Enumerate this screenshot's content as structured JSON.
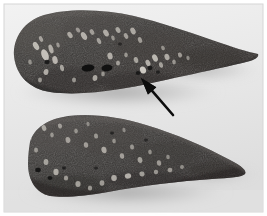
{
  "figure": {
    "kind": "gross-pathology-photograph",
    "caption": "",
    "width": 267,
    "height": 216,
    "background_color": "#ffffff",
    "photo_paper_color": "#ebebeb",
    "vignette_color": "#dcdcdc"
  },
  "specimens": [
    {
      "id": "upper-slice",
      "label": "",
      "description": "upper cut tissue slice, rounded left end tapering to a point at right",
      "tissue_color": "#3c3a38",
      "tissue_color_dark": "#2b2a29",
      "tissue_color_light": "#5a5653",
      "edge_color": "#1d1c1c",
      "shadow_color": "#b9b9b9"
    },
    {
      "id": "lower-slice",
      "label": "",
      "description": "lower cut tissue slice, wedge shaped tapering to a sharp point at right",
      "tissue_color": "#3a3836",
      "tissue_color_dark": "#2a2928",
      "tissue_color_light": "#575350",
      "edge_color": "#1c1b1b",
      "shadow_color": "#bcbcbc"
    }
  ],
  "annotations": [
    {
      "id": "lesion-arrow",
      "type": "arrow",
      "label": "",
      "color": "#0c0c0c",
      "tip_x": 141,
      "tip_y": 78,
      "tail_x": 173,
      "tail_y": 115,
      "shaft_width": 2.6,
      "head_length": 17,
      "head_width": 11,
      "points_to": "pale lesion on upper slice"
    }
  ],
  "features": {
    "pale_nodule_color": "#d8d4cc",
    "pale_nodule_soft_color": "#a9a49c",
    "cavity_color": "#111111",
    "upper_pale_nodules": [
      {
        "cx": 36,
        "cy": 46,
        "rx": 2.6,
        "ry": 4.4,
        "rot": -30,
        "o": 0.8
      },
      {
        "cx": 41,
        "cy": 39,
        "rx": 1.8,
        "ry": 3.0,
        "rot": -25,
        "o": 0.62
      },
      {
        "cx": 45,
        "cy": 55,
        "rx": 3.4,
        "ry": 6.0,
        "rot": -22,
        "o": 0.85
      },
      {
        "cx": 51,
        "cy": 49,
        "rx": 2.2,
        "ry": 4.6,
        "rot": -18,
        "o": 0.7
      },
      {
        "cx": 55,
        "cy": 60,
        "rx": 2.6,
        "ry": 4.0,
        "rot": -15,
        "o": 0.78
      },
      {
        "cx": 58,
        "cy": 45,
        "rx": 1.6,
        "ry": 2.6,
        "rot": -20,
        "o": 0.55
      },
      {
        "cx": 62,
        "cy": 68,
        "rx": 2.0,
        "ry": 3.2,
        "rot": -10,
        "o": 0.66
      },
      {
        "cx": 46,
        "cy": 72,
        "rx": 2.4,
        "ry": 3.0,
        "rot": 10,
        "o": 0.72
      },
      {
        "cx": 40,
        "cy": 80,
        "rx": 2.0,
        "ry": 2.4,
        "rot": 0,
        "o": 0.58
      },
      {
        "cx": 70,
        "cy": 35,
        "rx": 2.2,
        "ry": 3.4,
        "rot": -35,
        "o": 0.68
      },
      {
        "cx": 78,
        "cy": 30,
        "rx": 1.8,
        "ry": 2.8,
        "rot": -40,
        "o": 0.55
      },
      {
        "cx": 84,
        "cy": 36,
        "rx": 2.6,
        "ry": 4.2,
        "rot": -30,
        "o": 0.74
      },
      {
        "cx": 92,
        "cy": 32,
        "rx": 2.0,
        "ry": 3.0,
        "rot": -30,
        "o": 0.6
      },
      {
        "cx": 99,
        "cy": 41,
        "rx": 1.9,
        "ry": 3.2,
        "rot": -25,
        "o": 0.63
      },
      {
        "cx": 106,
        "cy": 33,
        "rx": 2.4,
        "ry": 3.8,
        "rot": -30,
        "o": 0.7
      },
      {
        "cx": 113,
        "cy": 38,
        "rx": 1.7,
        "ry": 2.6,
        "rot": -20,
        "o": 0.54
      },
      {
        "cx": 118,
        "cy": 30,
        "rx": 2.2,
        "ry": 3.2,
        "rot": -28,
        "o": 0.66
      },
      {
        "cx": 126,
        "cy": 36,
        "rx": 2.0,
        "ry": 3.0,
        "rot": -25,
        "o": 0.62
      },
      {
        "cx": 133,
        "cy": 31,
        "rx": 2.4,
        "ry": 3.6,
        "rot": -28,
        "o": 0.68
      },
      {
        "cx": 140,
        "cy": 40,
        "rx": 2.0,
        "ry": 3.0,
        "rot": -22,
        "o": 0.6
      },
      {
        "cx": 110,
        "cy": 56,
        "rx": 2.6,
        "ry": 3.4,
        "rot": -12,
        "o": 0.72
      },
      {
        "cx": 118,
        "cy": 63,
        "rx": 2.0,
        "ry": 2.6,
        "rot": 0,
        "o": 0.62
      },
      {
        "cx": 126,
        "cy": 55,
        "rx": 1.8,
        "ry": 2.4,
        "rot": -10,
        "o": 0.56
      },
      {
        "cx": 136,
        "cy": 60,
        "rx": 2.2,
        "ry": 3.0,
        "rot": -15,
        "o": 0.66
      },
      {
        "cx": 143,
        "cy": 70,
        "rx": 3.0,
        "ry": 3.6,
        "rot": -20,
        "o": 0.92
      },
      {
        "cx": 148,
        "cy": 63,
        "rx": 2.2,
        "ry": 3.4,
        "rot": -25,
        "o": 0.74
      },
      {
        "cx": 155,
        "cy": 58,
        "rx": 2.6,
        "ry": 3.8,
        "rot": -25,
        "o": 0.8
      },
      {
        "cx": 161,
        "cy": 65,
        "rx": 2.0,
        "ry": 2.8,
        "rot": -18,
        "o": 0.64
      },
      {
        "cx": 167,
        "cy": 57,
        "rx": 2.4,
        "ry": 3.2,
        "rot": -22,
        "o": 0.7
      },
      {
        "cx": 174,
        "cy": 62,
        "rx": 1.8,
        "ry": 2.4,
        "rot": -15,
        "o": 0.56
      },
      {
        "cx": 180,
        "cy": 55,
        "rx": 2.0,
        "ry": 2.6,
        "rot": -20,
        "o": 0.6
      },
      {
        "cx": 188,
        "cy": 58,
        "rx": 1.6,
        "ry": 2.2,
        "rot": -15,
        "o": 0.5
      },
      {
        "cx": 163,
        "cy": 48,
        "rx": 1.8,
        "ry": 2.4,
        "rot": -25,
        "o": 0.52
      },
      {
        "cx": 95,
        "cy": 78,
        "rx": 2.4,
        "ry": 3.0,
        "rot": 5,
        "o": 0.7
      },
      {
        "cx": 103,
        "cy": 74,
        "rx": 1.8,
        "ry": 2.4,
        "rot": 0,
        "o": 0.56
      },
      {
        "cx": 74,
        "cy": 80,
        "rx": 2.0,
        "ry": 2.4,
        "rot": 5,
        "o": 0.58
      },
      {
        "cx": 30,
        "cy": 62,
        "rx": 1.8,
        "ry": 2.6,
        "rot": -10,
        "o": 0.52
      }
    ],
    "upper_cavities": [
      {
        "cx": 88,
        "cy": 68,
        "rx": 6.4,
        "ry": 3.6,
        "rot": -6,
        "o": 0.95
      },
      {
        "cx": 107,
        "cy": 68,
        "rx": 5.6,
        "ry": 3.4,
        "rot": -4,
        "o": 0.92
      },
      {
        "cx": 47,
        "cy": 62,
        "rx": 2.6,
        "ry": 2.2,
        "rot": 0,
        "o": 0.8
      },
      {
        "cx": 138,
        "cy": 73,
        "rx": 2.4,
        "ry": 2.0,
        "rot": 0,
        "o": 0.78
      },
      {
        "cx": 150,
        "cy": 68,
        "rx": 2.6,
        "ry": 2.2,
        "rot": -10,
        "o": 0.8
      },
      {
        "cx": 158,
        "cy": 72,
        "rx": 2.0,
        "ry": 1.8,
        "rot": 0,
        "o": 0.7
      },
      {
        "cx": 120,
        "cy": 44,
        "rx": 1.8,
        "ry": 1.5,
        "rot": 0,
        "o": 0.62
      }
    ],
    "lower_pale_nodules": [
      {
        "cx": 44,
        "cy": 128,
        "rx": 2.2,
        "ry": 3.0,
        "rot": -20,
        "o": 0.66
      },
      {
        "cx": 52,
        "cy": 135,
        "rx": 1.8,
        "ry": 2.4,
        "rot": -15,
        "o": 0.54
      },
      {
        "cx": 60,
        "cy": 126,
        "rx": 2.0,
        "ry": 2.6,
        "rot": -20,
        "o": 0.58
      },
      {
        "cx": 68,
        "cy": 140,
        "rx": 2.4,
        "ry": 3.0,
        "rot": -10,
        "o": 0.62
      },
      {
        "cx": 76,
        "cy": 131,
        "rx": 1.8,
        "ry": 2.4,
        "rot": -15,
        "o": 0.52
      },
      {
        "cx": 86,
        "cy": 145,
        "rx": 2.2,
        "ry": 2.8,
        "rot": -10,
        "o": 0.6
      },
      {
        "cx": 96,
        "cy": 136,
        "rx": 2.0,
        "ry": 2.6,
        "rot": -12,
        "o": 0.56
      },
      {
        "cx": 104,
        "cy": 150,
        "rx": 2.6,
        "ry": 3.2,
        "rot": -8,
        "o": 0.68
      },
      {
        "cx": 114,
        "cy": 141,
        "rx": 1.8,
        "ry": 2.4,
        "rot": -10,
        "o": 0.52
      },
      {
        "cx": 122,
        "cy": 156,
        "rx": 2.2,
        "ry": 2.8,
        "rot": -8,
        "o": 0.62
      },
      {
        "cx": 132,
        "cy": 147,
        "rx": 2.0,
        "ry": 2.6,
        "rot": -10,
        "o": 0.56
      },
      {
        "cx": 140,
        "cy": 160,
        "rx": 2.4,
        "ry": 3.0,
        "rot": -8,
        "o": 0.64
      },
      {
        "cx": 150,
        "cy": 152,
        "rx": 1.8,
        "ry": 2.4,
        "rot": -10,
        "o": 0.52
      },
      {
        "cx": 159,
        "cy": 163,
        "rx": 2.2,
        "ry": 2.8,
        "rot": -8,
        "o": 0.6
      },
      {
        "cx": 168,
        "cy": 157,
        "rx": 1.8,
        "ry": 2.2,
        "rot": -10,
        "o": 0.5
      },
      {
        "cx": 36,
        "cy": 150,
        "rx": 2.0,
        "ry": 2.6,
        "rot": 0,
        "o": 0.56
      },
      {
        "cx": 46,
        "cy": 162,
        "rx": 2.4,
        "ry": 3.0,
        "rot": 0,
        "o": 0.64
      },
      {
        "cx": 56,
        "cy": 172,
        "rx": 2.6,
        "ry": 3.2,
        "rot": 0,
        "o": 0.7
      },
      {
        "cx": 66,
        "cy": 178,
        "rx": 2.2,
        "ry": 2.6,
        "rot": 0,
        "o": 0.6
      },
      {
        "cx": 78,
        "cy": 184,
        "rx": 2.6,
        "ry": 3.0,
        "rot": 0,
        "o": 0.66
      },
      {
        "cx": 90,
        "cy": 188,
        "rx": 2.2,
        "ry": 2.6,
        "rot": 0,
        "o": 0.58
      },
      {
        "cx": 102,
        "cy": 183,
        "rx": 2.4,
        "ry": 2.8,
        "rot": 0,
        "o": 0.62
      },
      {
        "cx": 114,
        "cy": 178,
        "rx": 2.8,
        "ry": 3.0,
        "rot": -5,
        "o": 0.72
      },
      {
        "cx": 128,
        "cy": 176,
        "rx": 3.2,
        "ry": 2.6,
        "rot": -8,
        "o": 0.76
      },
      {
        "cx": 142,
        "cy": 174,
        "rx": 2.6,
        "ry": 2.4,
        "rot": -8,
        "o": 0.64
      },
      {
        "cx": 156,
        "cy": 172,
        "rx": 2.2,
        "ry": 2.2,
        "rot": -8,
        "o": 0.58
      },
      {
        "cx": 170,
        "cy": 170,
        "rx": 2.4,
        "ry": 2.2,
        "rot": -8,
        "o": 0.6
      },
      {
        "cx": 182,
        "cy": 167,
        "rx": 2.0,
        "ry": 2.0,
        "rot": -8,
        "o": 0.52
      },
      {
        "cx": 30,
        "cy": 138,
        "rx": 1.8,
        "ry": 2.4,
        "rot": 0,
        "o": 0.5
      },
      {
        "cx": 88,
        "cy": 124,
        "rx": 1.6,
        "ry": 2.2,
        "rot": -15,
        "o": 0.46
      },
      {
        "cx": 124,
        "cy": 130,
        "rx": 1.6,
        "ry": 2.2,
        "rot": -12,
        "o": 0.46
      }
    ],
    "lower_cavities": [
      {
        "cx": 38,
        "cy": 170,
        "rx": 2.8,
        "ry": 2.2,
        "rot": 0,
        "o": 0.88
      },
      {
        "cx": 50,
        "cy": 178,
        "rx": 2.4,
        "ry": 2.0,
        "rot": 0,
        "o": 0.82
      },
      {
        "cx": 64,
        "cy": 168,
        "rx": 2.0,
        "ry": 1.8,
        "rot": 0,
        "o": 0.72
      },
      {
        "cx": 112,
        "cy": 133,
        "rx": 1.8,
        "ry": 1.6,
        "rot": 0,
        "o": 0.66
      },
      {
        "cx": 146,
        "cy": 140,
        "rx": 1.8,
        "ry": 1.6,
        "rot": 0,
        "o": 0.62
      },
      {
        "cx": 96,
        "cy": 168,
        "rx": 1.8,
        "ry": 1.6,
        "rot": 0,
        "o": 0.62
      }
    ]
  }
}
